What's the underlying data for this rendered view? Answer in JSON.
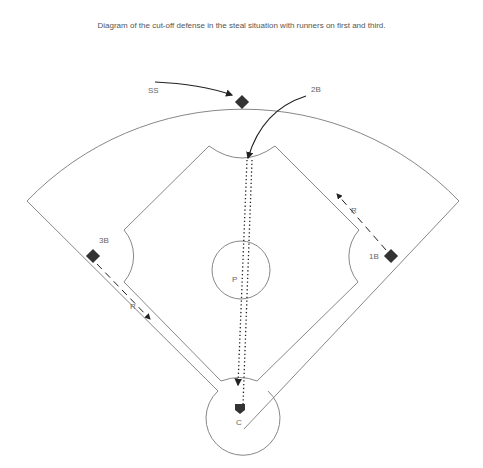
{
  "caption": "Diagram of the cut-off defense in the steal situation with runners on first and third.",
  "labels": {
    "ss": "SS",
    "second_base": "2B",
    "third_base": "3B",
    "first_base": "1B",
    "pitcher": "P",
    "catcher": "C",
    "runner_third": "R",
    "runner_first": "R"
  },
  "colors": {
    "line": "#888888",
    "base": "#333333",
    "arrow": "#222222",
    "text": "#666666"
  }
}
